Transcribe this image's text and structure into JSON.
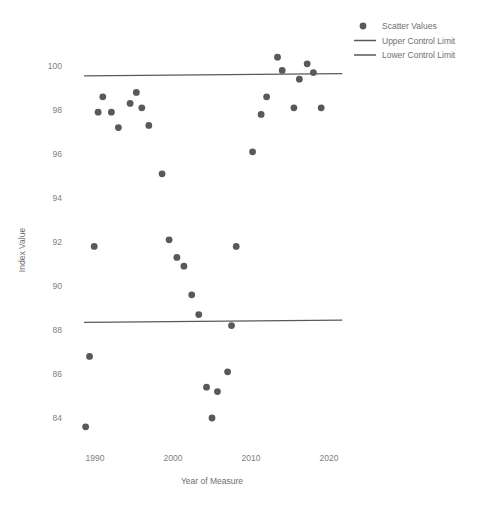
{
  "chart_data": {
    "type": "scatter",
    "title": "",
    "xlabel": "Year of Measure",
    "ylabel": "Index Value",
    "xlim": [
      1987,
      2022
    ],
    "ylim": [
      83,
      101
    ],
    "grid": false,
    "legend_position": "top-right",
    "xticks": [
      1990,
      2000,
      2010,
      2020
    ],
    "yticks": [
      84,
      86,
      88,
      90,
      92,
      94,
      96,
      98,
      100
    ],
    "series": [
      {
        "name": "Scatter Values",
        "type": "scatter",
        "color": "#595959",
        "marker": "circle",
        "points": [
          [
            1988.8,
            83.6
          ],
          [
            1989.3,
            86.8
          ],
          [
            1989.9,
            91.8
          ],
          [
            1990.4,
            97.9
          ],
          [
            1991.0,
            98.6
          ],
          [
            1992.1,
            97.9
          ],
          [
            1993.0,
            97.2
          ],
          [
            1994.5,
            98.3
          ],
          [
            1995.3,
            98.8
          ],
          [
            1996.0,
            98.1
          ],
          [
            1996.9,
            97.3
          ],
          [
            1998.6,
            95.1
          ],
          [
            1999.5,
            92.1
          ],
          [
            2000.5,
            91.3
          ],
          [
            2001.4,
            90.9
          ],
          [
            2002.4,
            89.6
          ],
          [
            2003.3,
            88.7
          ],
          [
            2004.3,
            85.4
          ],
          [
            2005.0,
            84.0
          ],
          [
            2005.7,
            85.2
          ],
          [
            2007.0,
            86.1
          ],
          [
            2007.5,
            88.2
          ],
          [
            2008.1,
            91.8
          ],
          [
            2010.2,
            96.1
          ],
          [
            2011.3,
            97.8
          ],
          [
            2012.0,
            98.6
          ],
          [
            2013.4,
            100.4
          ],
          [
            2014.0,
            99.8
          ],
          [
            2015.5,
            98.1
          ],
          [
            2016.2,
            99.4
          ],
          [
            2017.2,
            100.1
          ],
          [
            2018.0,
            99.7
          ],
          [
            2019.0,
            98.1
          ]
        ]
      },
      {
        "name": "Upper Control Limit",
        "type": "line",
        "color": "#595959",
        "x": [
          1988.6,
          2021.7
        ],
        "y": [
          99.55,
          99.65
        ]
      },
      {
        "name": "Lower Control Limit",
        "type": "line",
        "color": "#595959",
        "x": [
          1988.6,
          2021.7
        ],
        "y": [
          88.35,
          88.45
        ]
      }
    ]
  },
  "axis": {
    "y_title": "Index Value",
    "x_title": "Year of Measure",
    "y_ticks": [
      "100",
      "98",
      "96",
      "94",
      "92",
      "90",
      "88",
      "86",
      "84"
    ],
    "x_ticks": [
      "1990",
      "2000",
      "2010",
      "2020"
    ]
  },
  "legend": {
    "entries": [
      {
        "label": "Scatter Values",
        "kind": "marker",
        "color": "#595959"
      },
      {
        "label": "Upper Control Limit",
        "kind": "line",
        "color": "#595959"
      },
      {
        "label": "Lower Control Limit",
        "kind": "line",
        "color": "#595959"
      }
    ]
  },
  "style": {
    "background": "#ffffff",
    "marker_color": "#595959",
    "line_color": "#595959",
    "tick_color": "#808080",
    "title_color": "#6f6f6f"
  }
}
